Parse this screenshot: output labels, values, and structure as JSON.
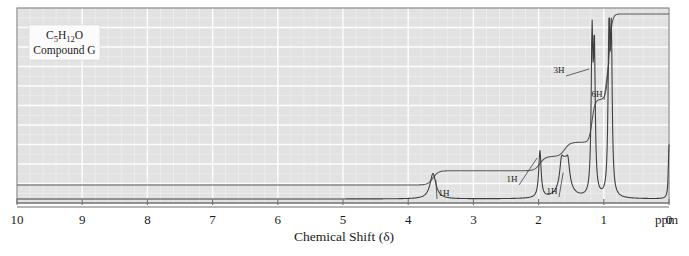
{
  "figure": {
    "sample_box": {
      "formula_prefix": "C",
      "formula": "C5H12O",
      "formula_parts": [
        {
          "t": "C",
          "sub": false
        },
        {
          "t": "5",
          "sub": true
        },
        {
          "t": "H",
          "sub": false
        },
        {
          "t": "12",
          "sub": true
        },
        {
          "t": "O",
          "sub": false
        }
      ],
      "compound_label": "Compound G"
    },
    "axis": {
      "title": "Chemical Shift (δ)",
      "unit_label": "ppm",
      "ticks": [
        "10",
        "9",
        "8",
        "7",
        "6",
        "5",
        "4",
        "3",
        "2",
        "1",
        "0"
      ],
      "tick_values": [
        10,
        9,
        8,
        7,
        6,
        5,
        4,
        3,
        2,
        1,
        0
      ],
      "min": 0,
      "max": 10,
      "direction": "reversed"
    },
    "annotations": [
      {
        "label": "1H",
        "shift": 3.6,
        "x": 444,
        "y": 196
      },
      {
        "label": "1H",
        "shift": 2.0,
        "x": 512,
        "y": 182
      },
      {
        "label": "1H",
        "shift": 1.6,
        "x": 552,
        "y": 194
      },
      {
        "label": "3H",
        "shift": 1.2,
        "x": 559,
        "y": 73
      },
      {
        "label": "6H",
        "shift": 0.9,
        "x": 597,
        "y": 97
      }
    ],
    "colors": {
      "plot_background": "#e2e2e2",
      "grid_major": "#fdfdfd",
      "grid_minor": "#ededed",
      "trace": "#4a4a4a",
      "frame": "#8a8a8a",
      "page_background": "#ffffff",
      "text": "#1a1a1a",
      "label_box": "#fbfbfb"
    }
  },
  "chart_data": {
    "type": "line",
    "xlabel": "Chemical Shift (δ)",
    "ylabel": "",
    "xlim": [
      10,
      0
    ],
    "ylim": [
      0,
      100
    ],
    "grid": true,
    "legend": "none",
    "x_tick_labels": [
      "10",
      "9",
      "8",
      "7",
      "6",
      "5",
      "4",
      "3",
      "2",
      "1",
      "0"
    ],
    "unit": "ppm",
    "series": [
      {
        "name": "spectrum",
        "peaks": [
          {
            "shift": 3.62,
            "integration": "1H",
            "height": 14,
            "multiplicity": "multiplet",
            "assignment": "CH-O"
          },
          {
            "shift": 1.98,
            "integration": "1H",
            "height": 26,
            "multiplicity": "broad singlet",
            "assignment": "OH"
          },
          {
            "shift": 1.6,
            "integration": "1H",
            "height": 18,
            "multiplicity": "multiplet",
            "assignment": "CH"
          },
          {
            "shift": 1.18,
            "integration": "3H",
            "height": 84,
            "multiplicity": "doublet",
            "assignment": "CH3"
          },
          {
            "shift": 0.92,
            "integration": "6H",
            "height": 92,
            "multiplicity": "doublet",
            "assignment": "2 x CH3"
          },
          {
            "shift": 0.0,
            "integration": "",
            "height": 30,
            "multiplicity": "singlet",
            "assignment": "TMS reference"
          }
        ]
      },
      {
        "name": "integration trace",
        "steps": [
          {
            "shift": 3.62,
            "rise": 1
          },
          {
            "shift": 1.98,
            "rise": 1
          },
          {
            "shift": 1.6,
            "rise": 1
          },
          {
            "shift": 1.18,
            "rise": 3
          },
          {
            "shift": 0.92,
            "rise": 6
          }
        ],
        "total_protons": 12
      }
    ]
  }
}
